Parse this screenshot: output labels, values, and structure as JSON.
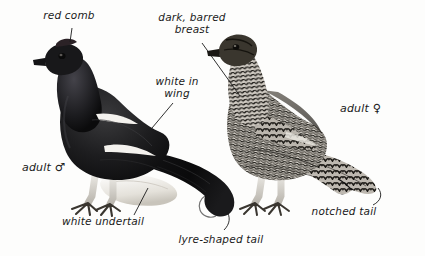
{
  "plate": {
    "title": "Black Grouse plate",
    "background_color": "#fdfdfc",
    "ink_color": "#1a1a1a"
  },
  "subjects": [
    {
      "id": "male",
      "name": "adult male black grouse",
      "plumage": "glossy blue-black, white wing bar, white undertail, lyre-shaped tail"
    },
    {
      "id": "female",
      "name": "adult female black grouse",
      "plumage": "barred grey-brown, notched tail"
    }
  ],
  "labels": [
    {
      "id": "red-comb",
      "text": "red comb"
    },
    {
      "id": "dark-barred",
      "text": "dark, barred\nbreast"
    },
    {
      "id": "white-in-wing",
      "text": "white in\nwing"
    },
    {
      "id": "adult-male",
      "text": "adult ",
      "symbol": "♂"
    },
    {
      "id": "adult-female",
      "text": "adult ",
      "symbol": "♀"
    },
    {
      "id": "white-undertail",
      "text": "white undertail"
    },
    {
      "id": "lyre-tail",
      "text": "lyre-shaped tail"
    },
    {
      "id": "notched-tail",
      "text": "notched tail"
    }
  ]
}
